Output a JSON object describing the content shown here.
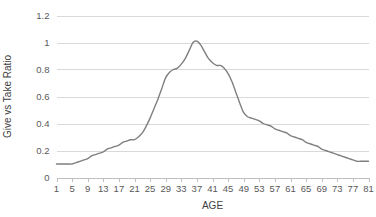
{
  "chart_data": {
    "type": "line",
    "title": "",
    "xlabel": "AGE",
    "ylabel": "Give vs Take Ratio",
    "xlim": [
      1,
      81
    ],
    "ylim": [
      0,
      1.2
    ],
    "grid": "horizontal",
    "legend": "none",
    "line_color": "#7f7f7f",
    "gridline_color": "#d9d9d9",
    "axis_color": "#bfbfbf",
    "text_color": "#595959",
    "y_ticks": [
      "0",
      "0.2",
      "0.4",
      "0.6",
      "0.8",
      "1",
      "1.2"
    ],
    "y_tick_values": [
      0,
      0.2,
      0.4,
      0.6,
      0.8,
      1,
      1.2
    ],
    "x_ticks": [
      "1",
      "5",
      "9",
      "13",
      "17",
      "21",
      "25",
      "29",
      "33",
      "37",
      "41",
      "45",
      "49",
      "53",
      "57",
      "61",
      "65",
      "69",
      "73",
      "77",
      "81"
    ],
    "x_tick_values": [
      1,
      5,
      9,
      13,
      17,
      21,
      25,
      29,
      33,
      37,
      41,
      45,
      49,
      53,
      57,
      61,
      65,
      69,
      73,
      77,
      81
    ],
    "x": [
      1,
      2,
      3,
      4,
      5,
      6,
      7,
      8,
      9,
      10,
      11,
      12,
      13,
      14,
      15,
      16,
      17,
      18,
      19,
      20,
      21,
      22,
      23,
      24,
      25,
      26,
      27,
      28,
      29,
      30,
      31,
      32,
      33,
      34,
      35,
      36,
      37,
      38,
      39,
      40,
      41,
      42,
      43,
      44,
      45,
      46,
      47,
      48,
      49,
      50,
      51,
      52,
      53,
      54,
      55,
      56,
      57,
      58,
      59,
      60,
      61,
      62,
      63,
      64,
      65,
      66,
      67,
      68,
      69,
      70,
      71,
      72,
      73,
      74,
      75,
      76,
      77,
      78,
      79,
      80,
      81
    ],
    "values": [
      0.1,
      0.1,
      0.1,
      0.1,
      0.1,
      0.11,
      0.12,
      0.13,
      0.14,
      0.16,
      0.17,
      0.18,
      0.19,
      0.21,
      0.22,
      0.23,
      0.24,
      0.26,
      0.27,
      0.28,
      0.28,
      0.3,
      0.33,
      0.38,
      0.44,
      0.51,
      0.58,
      0.66,
      0.74,
      0.78,
      0.8,
      0.81,
      0.84,
      0.88,
      0.94,
      1.0,
      1.01,
      0.98,
      0.93,
      0.88,
      0.85,
      0.83,
      0.83,
      0.81,
      0.77,
      0.71,
      0.63,
      0.55,
      0.48,
      0.45,
      0.44,
      0.43,
      0.42,
      0.4,
      0.39,
      0.38,
      0.36,
      0.35,
      0.34,
      0.33,
      0.31,
      0.3,
      0.29,
      0.28,
      0.26,
      0.25,
      0.24,
      0.23,
      0.21,
      0.2,
      0.19,
      0.18,
      0.17,
      0.16,
      0.15,
      0.14,
      0.13,
      0.12,
      0.12,
      0.12,
      0.12
    ],
    "series": [
      {
        "name": "Give vs Take Ratio",
        "values": [
          0.1,
          0.1,
          0.1,
          0.1,
          0.1,
          0.11,
          0.12,
          0.13,
          0.14,
          0.16,
          0.17,
          0.18,
          0.19,
          0.21,
          0.22,
          0.23,
          0.24,
          0.26,
          0.27,
          0.28,
          0.28,
          0.3,
          0.33,
          0.38,
          0.44,
          0.51,
          0.58,
          0.66,
          0.74,
          0.78,
          0.8,
          0.81,
          0.84,
          0.88,
          0.94,
          1.0,
          1.01,
          0.98,
          0.93,
          0.88,
          0.85,
          0.83,
          0.83,
          0.81,
          0.77,
          0.71,
          0.63,
          0.55,
          0.48,
          0.45,
          0.44,
          0.43,
          0.42,
          0.4,
          0.39,
          0.38,
          0.36,
          0.35,
          0.34,
          0.33,
          0.31,
          0.3,
          0.29,
          0.28,
          0.26,
          0.25,
          0.24,
          0.23,
          0.21,
          0.2,
          0.19,
          0.18,
          0.17,
          0.16,
          0.15,
          0.14,
          0.13,
          0.12,
          0.12,
          0.12,
          0.12
        ]
      }
    ]
  }
}
